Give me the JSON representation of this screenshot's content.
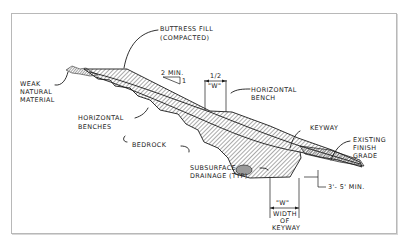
{
  "diagram": {
    "type": "cross-section",
    "labels": {
      "buttress_fill": [
        "BUTTRESS FILL",
        "(COMPACTED)"
      ],
      "weak_material": [
        "WEAK",
        "NATURAL",
        "MATERIAL"
      ],
      "slope_ratio": "2 MIN.",
      "slope_ratio_rise": "1",
      "half_w": "1/2",
      "w_small": "\"W\"",
      "horizontal_bench": [
        "HORIZONTAL",
        "BENCH"
      ],
      "horizontal_benches": [
        "HORIZONTAL",
        "BENCHES"
      ],
      "bedrock": "BEDROCK",
      "keyway": "KEYWAY",
      "existing_grade": [
        "EXISTING",
        "FINISH",
        "GRADE"
      ],
      "subsurface_drainage": [
        "SUBSURFACE",
        "DRAINAGE (TYP)"
      ],
      "keyway_depth": "3'- 5' MIN.",
      "w_large": "\"W\"",
      "width_of_keyway": [
        "WIDTH",
        "OF",
        "KEYWAY"
      ]
    },
    "colors": {
      "ink": "#1a1a1a",
      "hatch": "#555555",
      "frame": "#b8b8b8",
      "background": "#ffffff"
    }
  }
}
